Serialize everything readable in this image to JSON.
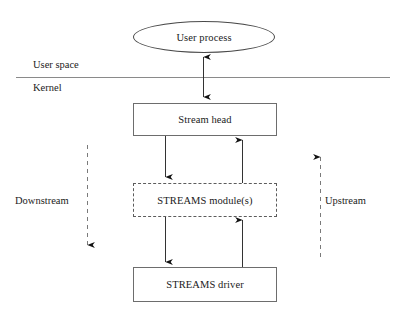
{
  "diagram": {
    "background_color": "#ffffff",
    "line_color": "#6d6d6d",
    "text_color": "#1b1b1b",
    "nodes": {
      "user_process": {
        "label": "User process",
        "shape": "ellipse",
        "border": "solid"
      },
      "stream_head": {
        "label": "Stream head",
        "shape": "rectangle",
        "border": "solid"
      },
      "streams_modules": {
        "label": "STREAMS module(s)",
        "shape": "rectangle",
        "border": "dashed"
      },
      "streams_driver": {
        "label": "STREAMS driver",
        "shape": "rectangle",
        "border": "solid"
      }
    },
    "layers": {
      "user_space": "User space",
      "kernel": "Kernel"
    },
    "flow_labels": {
      "downstream": "Downstream",
      "upstream": "Upstream"
    }
  }
}
